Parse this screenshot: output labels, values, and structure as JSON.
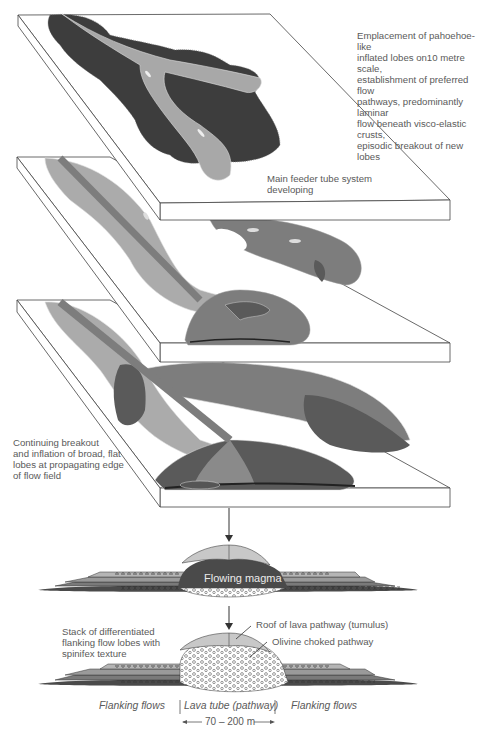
{
  "diagram": {
    "type": "block-diagram-sequence",
    "colors": {
      "stage1_lobes": "#3d3d3d",
      "stage1_pathway": "#a8a8a8",
      "light_lobes": "#ababab",
      "mid_lobes": "#7d7d7d",
      "dark_lobes": "#5a5a5a",
      "slab_edge": "#444444",
      "olivine_fill": "#ffffff",
      "magma": "#4a4a4a",
      "roof": "#c8c8c8"
    },
    "stage1": {
      "caption": "Emplacement of pahoehoe-like\ninflated lobes on10 metre scale,\nestablishment of preferred flow\npathways, predominantly laminar\nflow beneath visco-elastic crusts,\nepisodic breakout of new lobes"
    },
    "stage2": {
      "caption": "Main feeder tube system\ndeveloping"
    },
    "stage3": {
      "caption": "Continuing breakout\nand inflation of broad, flat\nlobes at propagating edge\nof flow field"
    },
    "section1": {
      "magma_label": "Flowing magma"
    },
    "section2": {
      "stack_label": "Stack of differentiated\nflanking flow lobes with\nspinifex texture",
      "roof_label": "Roof of lava pathway (tumulus)",
      "olivine_label": "Olivine choked pathway"
    },
    "bottom_axis": {
      "left_label": "Flanking flows",
      "center_label": "Lava tube (pathway)",
      "right_label": "Flanking flows",
      "scale_label": "70 – 200 m"
    }
  }
}
